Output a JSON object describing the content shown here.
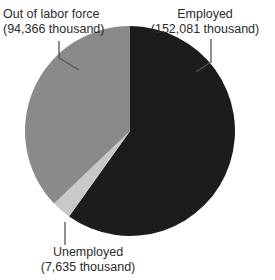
{
  "chart_data": {
    "type": "pie",
    "title": "",
    "subtitle": "",
    "xlabel": "",
    "ylabel": "",
    "unit": "thousand",
    "grid": false,
    "legend_position": "none",
    "label_style": "callout-with-leader-lines",
    "total": 254082,
    "categories": [
      "Employed",
      "Out of labor force",
      "Unemployed"
    ],
    "values": [
      152081,
      7635,
      94366
    ],
    "slices": [
      {
        "name": "Employed",
        "label": "Employed",
        "value": 152081,
        "value_text": "152,081 thousand",
        "percent": 59.9,
        "color": "#1c1c1c",
        "start_angle_deg": 0,
        "end_angle_deg": 215.5
      },
      {
        "name": "Unemployed",
        "label": "Unemployed",
        "value": 7635,
        "value_text": "7,635 thousand",
        "percent": 3.0,
        "color": "#c8c8c8",
        "start_angle_deg": 215.5,
        "end_angle_deg": 226.3
      },
      {
        "name": "Out of labor force",
        "label": "Out of labor force",
        "value": 94366,
        "value_text": "94,366 thousand",
        "percent": 37.1,
        "color": "#8a8a8a",
        "start_angle_deg": 226.3,
        "end_angle_deg": 360
      }
    ]
  },
  "labels": {
    "out_of_labor_force": {
      "name_line": "Out of labor force",
      "value_line": "(94,366 thousand)"
    },
    "employed": {
      "name_line": "Employed",
      "value_line": "(152,081 thousand)"
    },
    "unemployed": {
      "name_line": "Unemployed",
      "value_line": "(7,635 thousand)"
    }
  },
  "colors": {
    "employed": "#1c1c1c",
    "out_of_labor_force": "#8a8a8a",
    "unemployed": "#c8c8c8",
    "background": "#ffffff",
    "text": "#2b2b2b",
    "leader_line": "#555555"
  }
}
